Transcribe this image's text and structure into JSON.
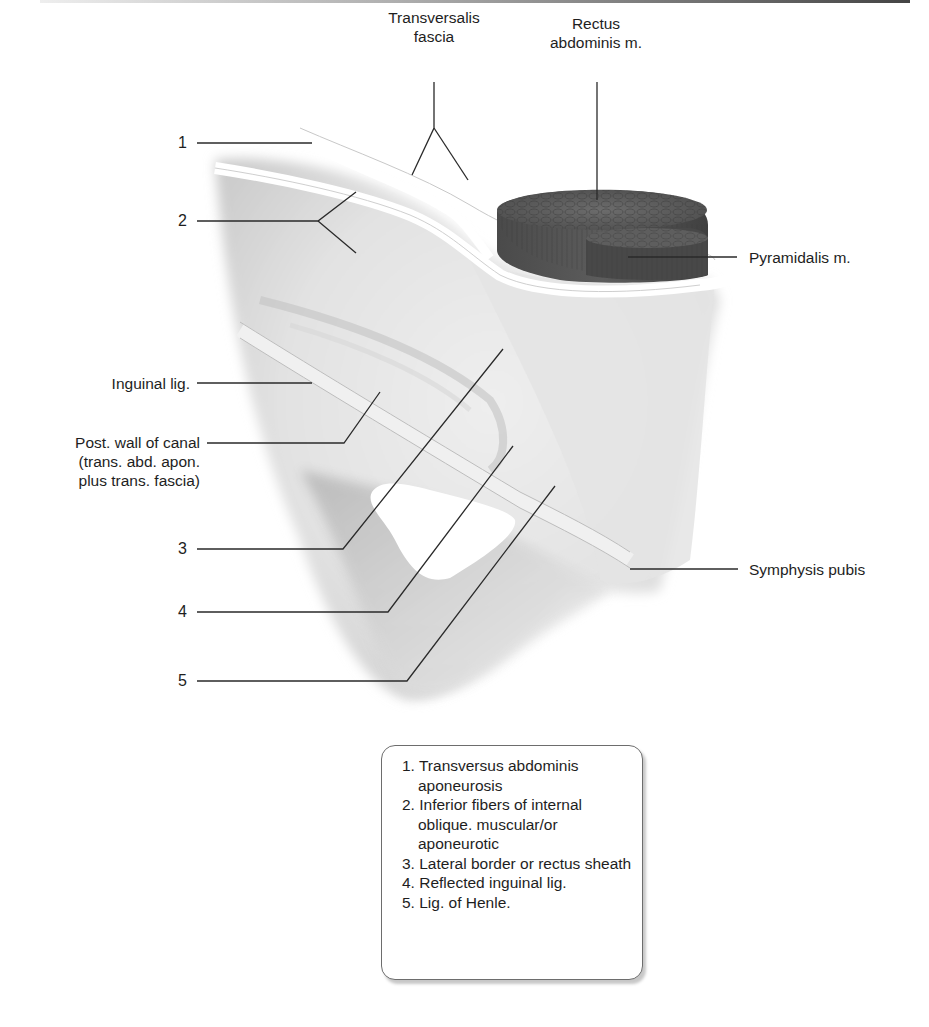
{
  "figure": {
    "labels": {
      "transversalis_fascia": [
        "Transversalis",
        "fascia"
      ],
      "rectus_abdominis": [
        "Rectus",
        "abdominis m."
      ],
      "pyramidalis": "Pyramidalis m.",
      "inguinal_lig": "Inguinal lig.",
      "post_wall": [
        "Post. wall of canal",
        "(trans. abd. apon.",
        "plus trans. fascia)"
      ],
      "symphysis_pubis": "Symphysis pubis"
    },
    "numbers": [
      "1",
      "2",
      "3",
      "4",
      "5"
    ],
    "colors": {
      "line": "#2a2a2a",
      "muscle": "#555555",
      "muscle_dark": "#3c3c3c",
      "tissue_light": "#e6e6e6",
      "tissue_mid": "#cfcfcf"
    }
  },
  "legend": {
    "items": [
      "1. Transversus abdominis aponeurosis",
      "2. Inferior fibers of internal oblique. muscular/or aponeurotic",
      "3. Lateral border or rectus sheath",
      "4. Reflected inguinal lig.",
      "5. Lig. of Henle."
    ]
  }
}
